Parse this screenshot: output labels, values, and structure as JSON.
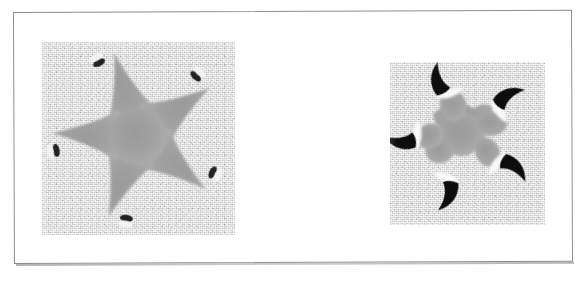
{
  "figure": {
    "caption": "",
    "frame": {
      "border_color": "#8d8d8d",
      "background": "#ffffff"
    },
    "page_background": "#fefefe"
  },
  "panels": [
    {
      "id": "left-panel",
      "label": "original-noisy-star-image",
      "description": "Grayscale noisy image of a five-pointed starfish-like star with small dark tips at each arm",
      "x": 42,
      "y": 42,
      "width": 193,
      "height": 193,
      "background_color": "#d6d6d6",
      "star_fill": "#a3a3a3",
      "tip_color": "#1e1e1e",
      "arm_count": 5,
      "center": {
        "x": 96,
        "y": 94
      },
      "outer_radius": 88,
      "inner_radius": 30,
      "rotation_deg": -16
    },
    {
      "id": "right-panel",
      "label": "segmented-star-image",
      "description": "Grayscale noisy image of the same five-pointed star after processing: gray core with white gaps and black curved blade-shaped arm tips",
      "x": 390,
      "y": 62,
      "width": 155,
      "height": 163,
      "background_color": "#d4d4d4",
      "star_fill": "#a6a6a6",
      "gap_color": "#fbfbfb",
      "tip_color": "#101010",
      "arm_count": 5,
      "center": {
        "x": 72,
        "y": 74
      },
      "core_radius": 46,
      "inner_radius": 22,
      "rotation_deg": -16
    }
  ],
  "colors": {
    "page": "#fefefe",
    "frame_border": "#8d8d8d",
    "panel_background": "#d5d5d5",
    "star_gray": "#a3a3a3",
    "tip_black": "#141414",
    "gap_white": "#fbfbfb"
  }
}
